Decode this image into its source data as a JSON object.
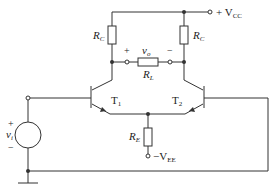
{
  "diagram": {
    "type": "differential amplifier circuit",
    "labels": {
      "vcc": "+ V",
      "vcc_sub": "CC",
      "rc_left": "R",
      "rc_left_sub": "C",
      "rc_right": "R",
      "rc_right_sub": "C",
      "vo": "v",
      "vo_sub": "o",
      "rl": "R",
      "rl_sub": "L",
      "plus_out": "+",
      "minus_out": "−",
      "t1": "T",
      "t1_sub": "1",
      "t2": "T",
      "t2_sub": "2",
      "re": "R",
      "re_sub": "E",
      "vee": "−V",
      "vee_sub": "EE",
      "vi": "v",
      "vi_sub": "i",
      "plus_in": "+",
      "minus_in": "−"
    }
  }
}
